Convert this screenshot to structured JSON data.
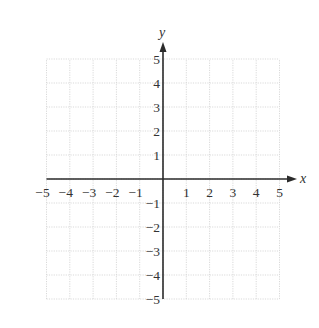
{
  "chart_data": {
    "type": "scatter",
    "title": "",
    "xlabel": "x",
    "ylabel": "y",
    "xlim": [
      -5,
      5
    ],
    "ylim": [
      -5,
      5
    ],
    "grid": true,
    "x_ticks": [
      -5,
      -4,
      -3,
      -2,
      -1,
      1,
      2,
      3,
      4,
      5
    ],
    "y_ticks": [
      -5,
      -4,
      -3,
      -2,
      -1,
      1,
      2,
      3,
      4,
      5
    ],
    "x_tick_labels": [
      "−5",
      "−4",
      "−3",
      "−2",
      "−1",
      "1",
      "2",
      "3",
      "4",
      "5"
    ],
    "y_tick_labels": [
      "−5",
      "−4",
      "−3",
      "−2",
      "−1",
      "1",
      "2",
      "3",
      "4",
      "5"
    ],
    "series": [],
    "legend": null
  },
  "layout": {
    "origin_px": [
      163,
      179
    ],
    "unit_px_x": 23.3,
    "unit_px_y": 24.0,
    "grid_color": "#d9d9d9",
    "axis_color": "#2b2b2b"
  }
}
